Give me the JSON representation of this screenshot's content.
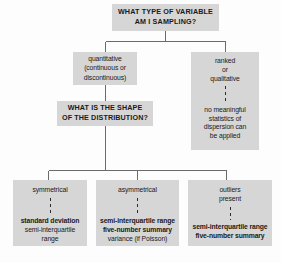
{
  "diagram": {
    "title_text": "WHAT TYPE OF VARIABLE AM I SAMPLING?",
    "fill_color": "#d6d6d6",
    "line_color": "#555555",
    "text_color": "#1a1a1a",
    "background": "#ffffff"
  },
  "nodes": {
    "root": {
      "name": "root-question",
      "lines": [
        "WHAT TYPE OF VARIABLE",
        "AM I SAMPLING?"
      ]
    },
    "quantitative": {
      "name": "quantitative-branch",
      "lines": [
        "quantitative",
        "(continuous or",
        "discontinuous)"
      ]
    },
    "ranked": {
      "name": "ranked-qualitative-branch",
      "lines_top": [
        "ranked",
        "or",
        "qualitative"
      ],
      "lines_bottom": [
        "no meaningful",
        "statistics of",
        "dispersion can",
        "be applied"
      ]
    },
    "shape": {
      "name": "shape-question",
      "lines": [
        "WHAT IS THE SHAPE",
        "OF THE DISTRIBUTION?"
      ]
    },
    "symmetrical": {
      "name": "symmetrical-leaf",
      "condition": [
        "symmetrical"
      ],
      "results": [
        {
          "text": "standard deviation",
          "bold": true
        },
        {
          "text": "semi-interquartile",
          "bold": false
        },
        {
          "text": "range",
          "bold": false
        }
      ]
    },
    "asymmetrical": {
      "name": "asymmetrical-leaf",
      "condition": [
        "asymmetrical"
      ],
      "results": [
        {
          "text": "semi-interquartile range",
          "bold": true
        },
        {
          "text": "five-number summary",
          "bold": true
        },
        {
          "text": "variance (if Poisson)",
          "bold": false
        }
      ]
    },
    "outliers": {
      "name": "outliers-leaf",
      "condition": [
        "outliers",
        "present"
      ],
      "results": [
        {
          "text": "semi-interquartile range",
          "bold": true
        },
        {
          "text": "five-number summary",
          "bold": true
        }
      ]
    }
  },
  "labels": {
    "root_line_1": "WHAT TYPE OF VARIABLE",
    "root_line_2": "AM I SAMPLING?",
    "quantitative_line_1": "quantitative",
    "quantitative_line_2": "(continuous or",
    "quantitative_line_3": "discontinuous)",
    "ranked_line_1": "ranked",
    "ranked_line_2": "or",
    "ranked_line_3": "qualitative",
    "ranked_line_4": "no meaningful",
    "ranked_line_5": "statistics of",
    "ranked_line_6": "dispersion can",
    "ranked_line_7": "be applied",
    "shape_line_1": "WHAT IS THE SHAPE",
    "shape_line_2": "OF THE DISTRIBUTION?",
    "sym_cond": "symmetrical",
    "sym_res_1": "standard deviation",
    "sym_res_2": "semi-interquartile",
    "sym_res_3": "range",
    "asym_cond": "asymmetrical",
    "asym_res_1": "semi-interquartile range",
    "asym_res_2": "five-number summary",
    "asym_res_3": "variance (if Poisson)",
    "out_cond_1": "outliers",
    "out_cond_2": "present",
    "out_res_1": "semi-interquartile range",
    "out_res_2": "five-number summary"
  }
}
